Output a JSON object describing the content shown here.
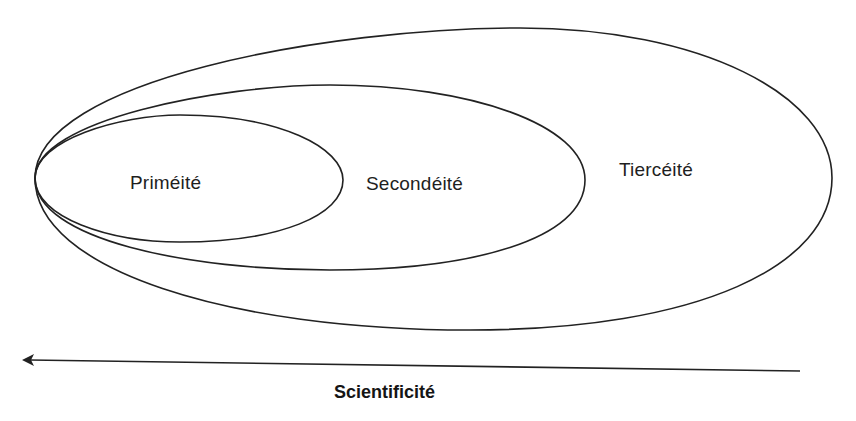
{
  "diagram": {
    "type": "nested-ellipses",
    "regions": [
      {
        "id": "primeite",
        "label": "Priméité",
        "level": 1
      },
      {
        "id": "secondeite",
        "label": "Secondéité",
        "level": 2
      },
      {
        "id": "tierceite",
        "label": "Tiercéité",
        "level": 3
      }
    ],
    "axis": {
      "label": "Scientificité",
      "direction": "right-to-left",
      "arrow_icon": "arrow-left-icon"
    },
    "colors": {
      "stroke": "#222222",
      "text": "#1e1e1e",
      "background": "#ffffff"
    }
  }
}
